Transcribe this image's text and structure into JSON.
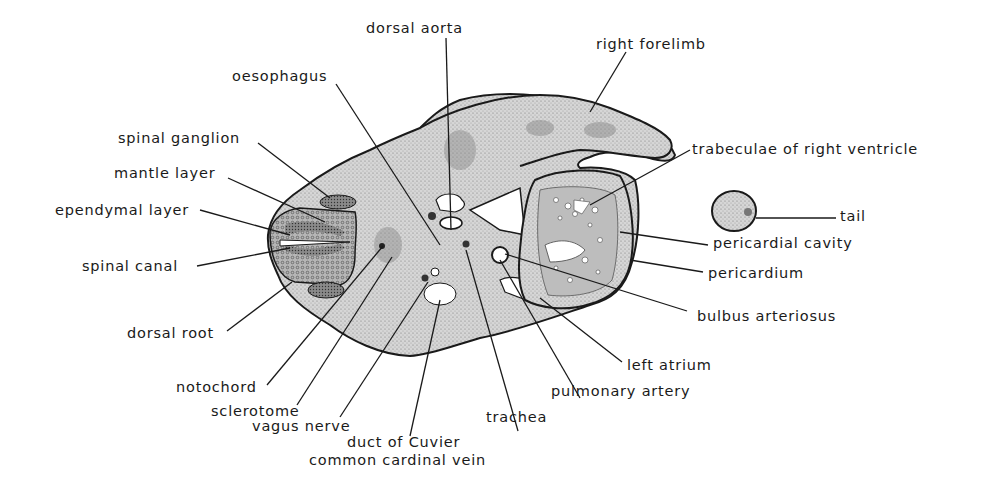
{
  "diagram": {
    "labels": {
      "dorsal_aorta": "dorsal aorta",
      "right_forelimb": "right forelimb",
      "oesophagus": "oesophagus",
      "spinal_ganglion": "spinal ganglion",
      "mantle_layer": "mantle layer",
      "ependymal_layer": "ependymal layer",
      "spinal_canal": "spinal canal",
      "dorsal_root": "dorsal root",
      "notochord": "notochord",
      "sclerotome": "sclerotome",
      "vagus_nerve": "vagus nerve",
      "duct_of_cuvier": "duct of Cuvier",
      "common_cardinal_vein": "common cardinal vein",
      "trachea": "trachea",
      "pulmonary_artery": "pulmonary artery",
      "left_atrium": "left atrium",
      "bulbus_arteriosus": "bulbus arteriosus",
      "pericardium": "pericardium",
      "pericardial_cavity": "pericardial cavity",
      "tail": "tail",
      "trabeculae": "trabeculae of right ventricle"
    }
  },
  "colors": {
    "ink": "#1a1a1a",
    "tissue": "#c9c9c9",
    "dark_tissue": "#6a6a6a",
    "background": "#ffffff"
  }
}
